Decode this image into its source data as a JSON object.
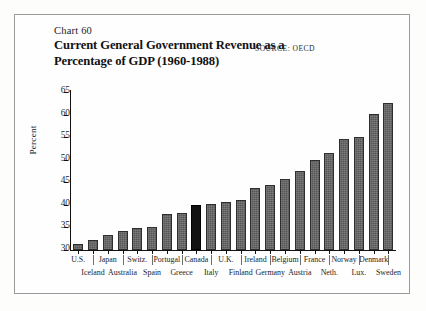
{
  "figure": {
    "chart_number": "Chart 60",
    "title_line_1": "Current General Government Revenue as a",
    "title_line_2": "Percentage of GDP (1960-1988)",
    "source": "SOURCE: OECD"
  },
  "chart_data": {
    "type": "bar",
    "title": "Current General Government Revenue as a Percentage of GDP (1960-1988)",
    "xlabel": "",
    "ylabel": "Percent",
    "ylim": [
      30,
      65
    ],
    "yticks": [
      30,
      35,
      40,
      45,
      50,
      55,
      60,
      65
    ],
    "grid": false,
    "legend": false,
    "source": "OECD",
    "highlight_category": "Canada",
    "highlight_color": "#121212",
    "bar_color": "#575757",
    "categories": [
      "U.S.",
      "Iceland",
      "Japan",
      "Australia",
      "Switz.",
      "Spain",
      "Portugal",
      "Greece",
      "Canada",
      "Italy",
      "U.K.",
      "Finland",
      "Ireland",
      "Germany",
      "Belgium",
      "Austria",
      "France",
      "Neth.",
      "Norway",
      "Lux.",
      "Denmark",
      "Sweden"
    ],
    "values": [
      31.3,
      32.3,
      33.3,
      34.2,
      34.8,
      35.0,
      38.0,
      38.3,
      40.0,
      40.3,
      40.7,
      41.0,
      43.8,
      44.3,
      45.8,
      47.5,
      50.0,
      51.5,
      54.5,
      55.0,
      60.2,
      62.6
    ],
    "label_rows": {
      "upper": [
        "U.S.",
        "Japan",
        "Switz.",
        "Portugal",
        "Canada",
        "Finland",
        "Ireland",
        "Belgium",
        "France",
        "Norway",
        "Denmark"
      ],
      "lower": [
        "Iceland",
        "Australia",
        "Spain",
        "Greece",
        "Italy",
        "U.K.",
        "Germany",
        "Austria",
        "Neth.",
        "Lux.",
        "Sweden"
      ]
    }
  }
}
